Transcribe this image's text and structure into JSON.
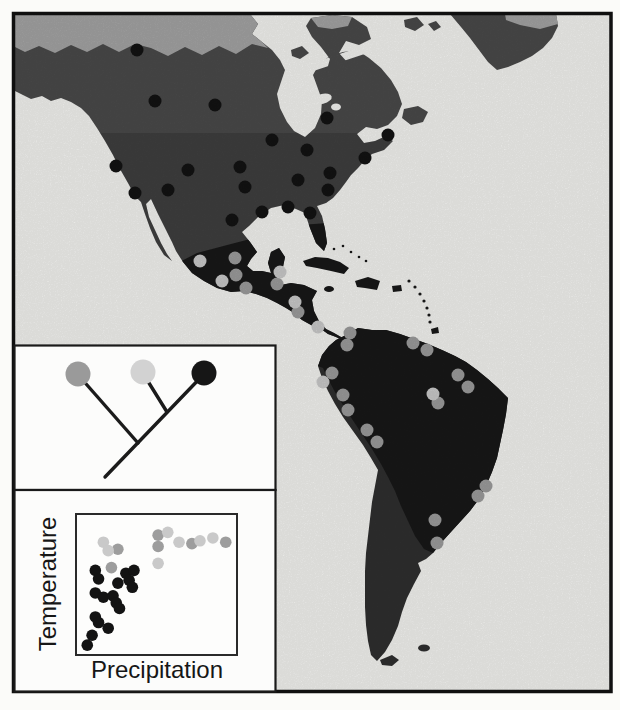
{
  "figure": {
    "background": "#fbfbf9",
    "frame_color": "#0f0f0f",
    "inset_border_color": "#1a1a1a",
    "inset_background": "#fcfcfb"
  },
  "map": {
    "biome_colors": {
      "ocean": "#f5f5f2",
      "tundra": "#a5a5a5",
      "boreal_temperate": "#4a4a4a",
      "tropical": "#181818",
      "southern_cone": "#2f2f2f"
    },
    "point_radius": 6.5,
    "group_colors": {
      "dark": "#131313",
      "mid": "#9d9d9d",
      "light": "#cbcbcb"
    },
    "points": {
      "dark": [
        [
          137,
          50
        ],
        [
          155,
          101
        ],
        [
          215,
          105
        ],
        [
          272,
          140
        ],
        [
          327,
          118
        ],
        [
          388,
          135
        ],
        [
          307,
          150
        ],
        [
          365,
          158
        ],
        [
          116,
          166
        ],
        [
          188,
          170
        ],
        [
          240,
          167
        ],
        [
          330,
          173
        ],
        [
          168,
          190
        ],
        [
          135,
          193
        ],
        [
          245,
          187
        ],
        [
          298,
          180
        ],
        [
          328,
          190
        ],
        [
          262,
          212
        ],
        [
          288,
          207
        ],
        [
          310,
          213
        ],
        [
          232,
          220
        ]
      ],
      "mid": [
        [
          235,
          258
        ],
        [
          236,
          275
        ],
        [
          246,
          288
        ],
        [
          277,
          284
        ],
        [
          298,
          312
        ],
        [
          350,
          333
        ],
        [
          347,
          345
        ],
        [
          413,
          343
        ],
        [
          427,
          350
        ],
        [
          332,
          373
        ],
        [
          343,
          395
        ],
        [
          348,
          410
        ],
        [
          367,
          430
        ],
        [
          377,
          442
        ],
        [
          458,
          375
        ],
        [
          468,
          387
        ],
        [
          438,
          403
        ],
        [
          486,
          486
        ],
        [
          478,
          496
        ],
        [
          435,
          520
        ],
        [
          437,
          543
        ]
      ],
      "light": [
        [
          200,
          261
        ],
        [
          222,
          281
        ],
        [
          280,
          272
        ],
        [
          295,
          302
        ],
        [
          318,
          327
        ],
        [
          323,
          382
        ],
        [
          433,
          394
        ]
      ]
    }
  },
  "tree": {
    "line_color": "#1b1b1b",
    "tips": [
      {
        "name": "mid-gray-clade",
        "color": "#9a9a9a"
      },
      {
        "name": "light-gray-clade",
        "color": "#d2d2d2"
      },
      {
        "name": "dark-clade",
        "color": "#161616"
      }
    ]
  },
  "chart_data": {
    "type": "scatter",
    "title": "",
    "xlabel": "Precipitation",
    "ylabel": "Temperature",
    "axes_numeric": false,
    "x_range": [
      0,
      1
    ],
    "y_range": [
      0,
      1
    ],
    "grid": false,
    "legend": "none",
    "point_radius": 5.8,
    "series": [
      {
        "name": "dark",
        "color": "#131313",
        "points": [
          [
            0.12,
            0.6
          ],
          [
            0.31,
            0.58
          ],
          [
            0.36,
            0.6
          ],
          [
            0.14,
            0.54
          ],
          [
            0.26,
            0.51
          ],
          [
            0.33,
            0.53
          ],
          [
            0.35,
            0.48
          ],
          [
            0.12,
            0.44
          ],
          [
            0.17,
            0.41
          ],
          [
            0.23,
            0.42
          ],
          [
            0.25,
            0.37
          ],
          [
            0.27,
            0.33
          ],
          [
            0.12,
            0.27
          ],
          [
            0.14,
            0.23
          ],
          [
            0.2,
            0.19
          ],
          [
            0.1,
            0.14
          ],
          [
            0.07,
            0.07
          ]
        ]
      },
      {
        "name": "mid",
        "color": "#9d9d9d",
        "points": [
          [
            0.26,
            0.75
          ],
          [
            0.22,
            0.62
          ],
          [
            0.51,
            0.85
          ],
          [
            0.51,
            0.77
          ],
          [
            0.72,
            0.79
          ],
          [
            0.93,
            0.8
          ]
        ]
      },
      {
        "name": "light",
        "color": "#c9c9c9",
        "points": [
          [
            0.17,
            0.8
          ],
          [
            0.2,
            0.74
          ],
          [
            0.57,
            0.87
          ],
          [
            0.64,
            0.8
          ],
          [
            0.77,
            0.81
          ],
          [
            0.85,
            0.83
          ],
          [
            0.51,
            0.65
          ]
        ]
      }
    ]
  }
}
